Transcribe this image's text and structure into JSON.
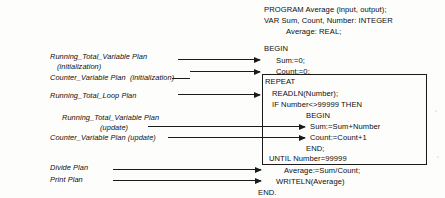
{
  "figure": {
    "ink_color": "#1a1a1a",
    "background_color": "#fdfdfc"
  },
  "code": {
    "language": "Pascal",
    "lines": [
      {
        "text": "PROGRAM Average (input, output);"
      },
      {
        "text": "VAR Sum, Count, Number: INTEGER"
      },
      {
        "text": "Average: REAL;"
      },
      {
        "text": "BEGIN"
      },
      {
        "text": "Sum:=0;"
      },
      {
        "text": "Count:=0;"
      },
      {
        "text": "REPEAT"
      },
      {
        "text": "READLN(Number);"
      },
      {
        "text": "IF Number<>99999 THEN"
      },
      {
        "text": "BEGIN"
      },
      {
        "text": "Sum:=Sum+Number"
      },
      {
        "text": "Count:=Count+1"
      },
      {
        "text": "END;"
      },
      {
        "text": "UNTIL Number=99999"
      },
      {
        "text": "Average:=Sum/Count;"
      },
      {
        "text": "WRITELN(Average)"
      },
      {
        "text": "END."
      }
    ]
  },
  "plans": [
    {
      "name": "running-total-variable-plan-initialization",
      "line1": "Running_Total_Variable Plan",
      "line2": "(initialization)",
      "target_code": "Sum:=0;"
    },
    {
      "name": "counter-variable-plan-initialization",
      "line1": "Counter_Variable Plan  (initialization)",
      "line2": "",
      "target_code": "Count:=0;"
    },
    {
      "name": "running-total-loop-plan",
      "line1": "Running_Total_Loop Plan",
      "line2": "",
      "target_code": "READLN(Number);"
    },
    {
      "name": "running-total-variable-plan-update",
      "line1": "Running_Total_Variable Plan",
      "line2": "(update)",
      "target_code": "Sum:=Sum+Number"
    },
    {
      "name": "counter-variable-plan-update",
      "line1": "Counter_Variable Plan (update)",
      "line2": "",
      "target_code": "Count:=Count+1"
    },
    {
      "name": "divide-plan",
      "line1": "Divide Plan",
      "line2": "",
      "target_code": "Average:=Sum/Count;"
    },
    {
      "name": "print-plan",
      "line1": "Print Plan",
      "line2": "",
      "target_code": "WRITELN(Average)"
    }
  ]
}
